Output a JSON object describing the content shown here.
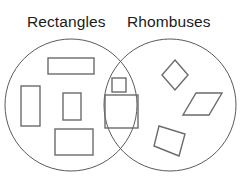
{
  "diagram": {
    "type": "venn-diagram",
    "title_left": "Rectangles",
    "title_right": "Rhombuses",
    "stroke_color": "#6b6b6b",
    "circle_stroke_color": "#5a5a5a",
    "text_color": "#1b1b1b",
    "background_color": "#ffffff",
    "circles": [
      {
        "name": "rectangles-circle",
        "cx": 71,
        "cy": 105,
        "r": 66
      },
      {
        "name": "rhombuses-circle",
        "cx": 170,
        "cy": 105,
        "r": 66
      }
    ],
    "regions": {
      "left_only": {
        "label": "Rectangles",
        "shape_count": 4,
        "shapes": [
          {
            "name": "wide-rectangle",
            "kind": "rectangle",
            "x": 48,
            "y": 58,
            "w": 46,
            "h": 16
          },
          {
            "name": "tall-rectangle",
            "kind": "rectangle",
            "x": 21,
            "y": 86,
            "w": 19,
            "h": 40
          },
          {
            "name": "small-upright-rectangle",
            "kind": "rectangle",
            "x": 63,
            "y": 93,
            "w": 18,
            "h": 27
          },
          {
            "name": "bottom-rectangle",
            "kind": "rectangle",
            "x": 55,
            "y": 129,
            "w": 38,
            "h": 26
          }
        ]
      },
      "intersection": {
        "label": "Squares",
        "shape_count": 2,
        "shapes": [
          {
            "name": "small-square",
            "kind": "square",
            "x": 112,
            "y": 78,
            "w": 14,
            "h": 14
          },
          {
            "name": "large-square",
            "kind": "square",
            "x": 105,
            "y": 95,
            "w": 33,
            "h": 33
          }
        ]
      },
      "right_only": {
        "label": "Rhombuses",
        "shape_count": 3,
        "shapes": [
          {
            "name": "diamond-rhombus",
            "kind": "rhombus",
            "points": "175,60 188,75 175,90 162,75"
          },
          {
            "name": "slanted-rhombus",
            "kind": "rhombus",
            "points": "196,93 222,93 209,115 183,115"
          },
          {
            "name": "tilted-square-rhombus",
            "kind": "rhombus",
            "points": "159,126 185,134 179,156 154,146"
          }
        ]
      }
    }
  }
}
